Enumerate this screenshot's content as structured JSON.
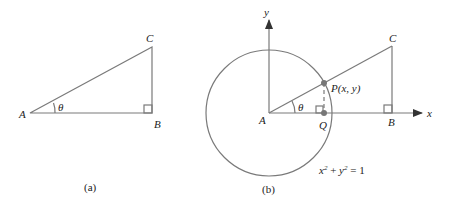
{
  "figure_a": {
    "caption": "(a)",
    "labels": {
      "A": "A",
      "B": "B",
      "C": "C",
      "theta": "θ"
    }
  },
  "figure_b": {
    "caption": "(b)",
    "labels": {
      "A": "A",
      "B": "B",
      "C": "C",
      "theta": "θ",
      "P": "P(x, y)",
      "Q": "Q",
      "x_axis": "x",
      "y_axis": "y"
    },
    "equation": {
      "base_x": "x",
      "sup_x": "2",
      "plus": " + ",
      "base_y": "y",
      "sup_y": "2",
      "rhs": " = 1"
    }
  },
  "colors": {
    "line": "#7a7a7a",
    "point": "#777777",
    "text": "#222222"
  }
}
